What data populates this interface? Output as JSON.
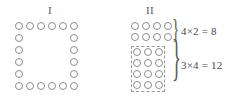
{
  "figure": {
    "background_color": "#ffffff",
    "circle_stroke_color": "#8c8c8c",
    "text_color": "#4a4a4a",
    "dashed_box_color": "#9a9a9a"
  },
  "panels": [
    {
      "heading": "I",
      "name": "hollow-square-arrangement",
      "description": "hollow square outline of circles",
      "grid_columns": 6,
      "grid_rows": 6,
      "total_circles": 20,
      "cell_pitch_x": 11,
      "cell_pitch_y": 12,
      "circle_diameter": 8,
      "ring_positions": [
        [
          0,
          0
        ],
        [
          1,
          0
        ],
        [
          2,
          0
        ],
        [
          3,
          0
        ],
        [
          4,
          0
        ],
        [
          5,
          0
        ],
        [
          0,
          1
        ],
        [
          5,
          1
        ],
        [
          0,
          2
        ],
        [
          5,
          2
        ],
        [
          0,
          3
        ],
        [
          5,
          3
        ],
        [
          0,
          4
        ],
        [
          5,
          4
        ],
        [
          0,
          5
        ],
        [
          1,
          5
        ],
        [
          2,
          5
        ],
        [
          3,
          5
        ],
        [
          4,
          5
        ],
        [
          5,
          5
        ]
      ]
    },
    {
      "heading": "II",
      "name": "rearranged-blocks",
      "description": "same circles rearranged into two rectangular blocks",
      "total_circles": 20,
      "cell_pitch_x": 11,
      "cell_pitch_y": 11,
      "circle_diameter": 8,
      "groups": [
        {
          "name": "top-block",
          "columns": 4,
          "rows": 2,
          "count": 8,
          "bordered": false,
          "brace": "}",
          "equation": "4×2 = 8"
        },
        {
          "name": "bottom-block",
          "columns": 3,
          "rows": 4,
          "count": 12,
          "bordered": true,
          "border_style": "dashed",
          "brace": "}",
          "equation": "3×4 = 12"
        }
      ]
    }
  ]
}
